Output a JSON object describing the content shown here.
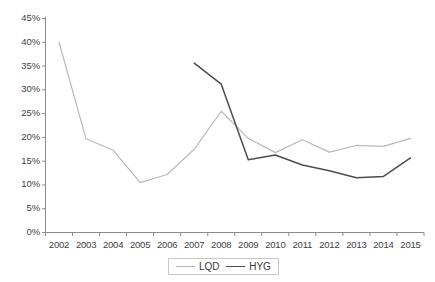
{
  "chart_data": {
    "type": "line",
    "title": "",
    "subtitle": "",
    "xlabel": "",
    "ylabel": "",
    "grid": false,
    "legend_position": "bottom-center",
    "x": [
      2002,
      2003,
      2004,
      2005,
      2006,
      2007,
      2008,
      2009,
      2010,
      2011,
      2012,
      2013,
      2014,
      2015
    ],
    "categories": [
      "2002",
      "2003",
      "2004",
      "2005",
      "2006",
      "2007",
      "2008",
      "2009",
      "2010",
      "2011",
      "2012",
      "2013",
      "2014",
      "2015"
    ],
    "ylim": [
      0,
      45
    ],
    "ytick_values": [
      0,
      5,
      10,
      15,
      20,
      25,
      30,
      35,
      40,
      45
    ],
    "ytick_labels": [
      "0%",
      "5%",
      "10%",
      "15%",
      "20%",
      "25%",
      "30%",
      "35%",
      "40%",
      "45%"
    ],
    "series": [
      {
        "name": "LQD",
        "color": "#b9b9b9",
        "x": [
          2002,
          2003,
          2004,
          2005,
          2006,
          2007,
          2008,
          2009,
          2010,
          2011,
          2012,
          2013,
          2014,
          2015
        ],
        "values": [
          40.0,
          19.7,
          17.3,
          10.5,
          12.2,
          17.5,
          25.5,
          19.8,
          16.8,
          19.5,
          16.9,
          18.3,
          18.1,
          19.8
        ]
      },
      {
        "name": "HYG",
        "color": "#4d4d4d",
        "x": [
          2007,
          2008,
          2009,
          2010,
          2011,
          2012,
          2013,
          2014,
          2015
        ],
        "values": [
          35.6,
          31.2,
          15.3,
          16.3,
          14.2,
          13.0,
          11.5,
          11.8,
          15.7
        ]
      }
    ]
  },
  "legend": {
    "entries": [
      {
        "label": "LQD"
      },
      {
        "label": "HYG"
      }
    ]
  },
  "colors": {
    "lqd_line": "#b9b9b9",
    "hyg_line": "#4d4d4d",
    "axis": "#8c8c8c",
    "text": "#3a3a3a",
    "background": "#ffffff"
  }
}
